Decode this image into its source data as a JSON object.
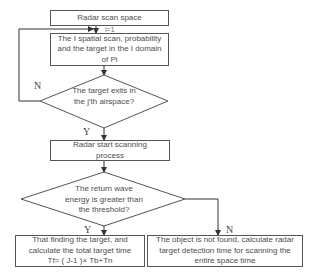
{
  "flowchart": {
    "start_box": "Radar scan space",
    "init_label": "i=1",
    "scan_box": "The I spatial scan, probability and the target in the I domain of Pi",
    "decision1": "The target exits in the j'th airspace?",
    "decision1_no": "N",
    "decision1_yes": "Y",
    "process_box": "Radar start scanning process",
    "decision2": "The return wave energy is greater than the threshold?",
    "decision2_yes": "Y",
    "decision2_no": "N",
    "found_box": "That finding the target, and calculate the total target time Tf= ( J-1 )× Tb+Tn",
    "not_found_box": "The object is not found, calculate radar target detection time for scanning the entire space time"
  }
}
